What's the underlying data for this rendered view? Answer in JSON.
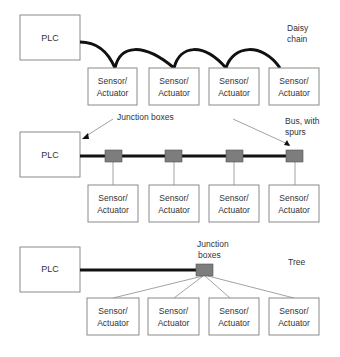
{
  "diagram": {
    "topologies": [
      {
        "name": "Daisy chain",
        "label_lines": [
          "Daisy",
          "chain"
        ],
        "controller": "PLC",
        "devices": [
          "Sensor/ Actuator",
          "Sensor/ Actuator",
          "Sensor/ Actuator",
          "Sensor/ Actuator"
        ]
      },
      {
        "name": "Bus, with spurs",
        "label_lines": [
          "Bus, with",
          "spurs"
        ],
        "controller": "PLC",
        "annotation": "Junction boxes",
        "junction_box_count": 4,
        "devices": [
          "Sensor/ Actuator",
          "Sensor/ Actuator",
          "Sensor/ Actuator",
          "Sensor/ Actuator"
        ]
      },
      {
        "name": "Tree",
        "label_lines": [
          "Tree"
        ],
        "controller": "PLC",
        "annotation_lines": [
          "Junction",
          "boxes"
        ],
        "junction_box_count": 1,
        "devices": [
          "Sensor/ Actuator",
          "Sensor/ Actuator",
          "Sensor/ Actuator",
          "Sensor/ Actuator"
        ]
      }
    ],
    "device_label_line1": "Sensor/",
    "device_label_line2": "Actuator",
    "colors": {
      "cable": "#111111",
      "junction_box": "#7d7d7d",
      "box_border": "#8a8a8a"
    }
  }
}
